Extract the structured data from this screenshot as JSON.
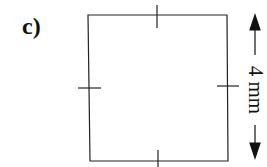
{
  "figure": {
    "label": "c)",
    "shape": "square",
    "dimension_label": "4 mm",
    "tick_marks": [
      "top",
      "right",
      "bottom",
      "left"
    ],
    "stroke_color": "#222222"
  }
}
